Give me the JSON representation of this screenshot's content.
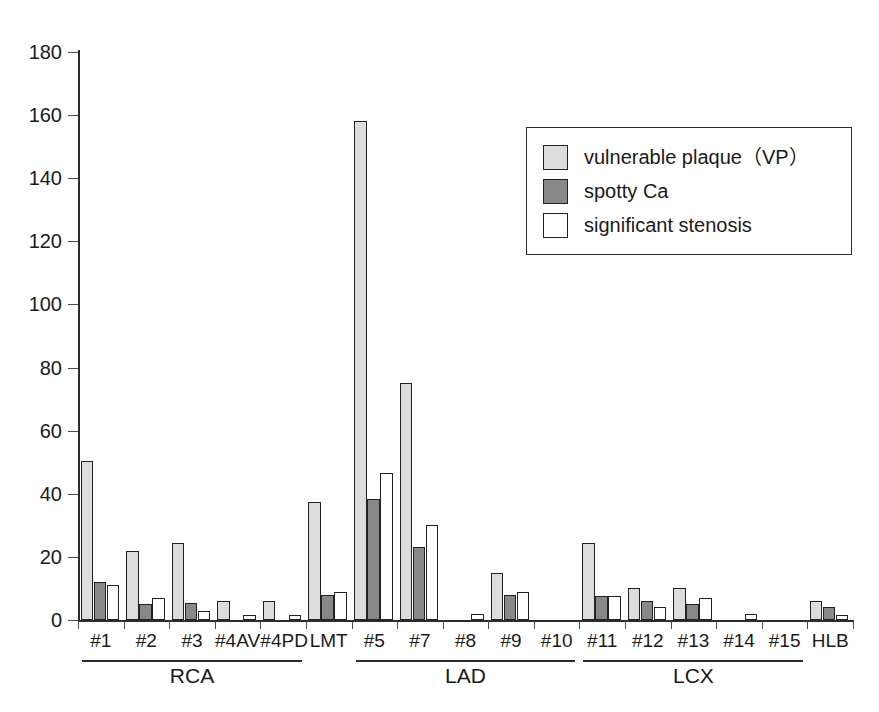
{
  "chart_data": {
    "type": "bar",
    "title": "",
    "xlabel": "",
    "ylabel": "",
    "ylim": [
      0,
      180
    ],
    "ytick_labels": [
      "180",
      "160",
      "140",
      "120",
      "100",
      "80",
      "60",
      "40",
      "20",
      "0"
    ],
    "yticks": [
      180,
      160,
      140,
      120,
      100,
      80,
      60,
      40,
      20,
      0
    ],
    "grid": false,
    "legend_position": "upper right",
    "categories": [
      "#1",
      "#2",
      "#3",
      "#4AV",
      "#4PD",
      "LMT",
      "#5",
      "#7",
      "#8",
      "#9",
      "#10",
      "#11",
      "#12",
      "#13",
      "#14",
      "#15",
      "HLB"
    ],
    "series": [
      {
        "name": "vulnerable plaque (VP)",
        "color": "#dcdcdc",
        "values": [
          50.5,
          22,
          24.5,
          6,
          6,
          37.5,
          158,
          75,
          0,
          15,
          0,
          24.5,
          10,
          10,
          0,
          0,
          6
        ]
      },
      {
        "name": "spotty Ca",
        "color": "#888888",
        "values": [
          12,
          5,
          5.5,
          0,
          0,
          8,
          38.5,
          23,
          0,
          8,
          0,
          7.5,
          6,
          5,
          0,
          0,
          4
        ]
      },
      {
        "name": "significant stenosis",
        "color": "#ffffff",
        "values": [
          11,
          7,
          3,
          1.5,
          1.5,
          9,
          46.5,
          30,
          2,
          9,
          0,
          7.5,
          4,
          7,
          2,
          0,
          1.5
        ]
      }
    ],
    "group_brackets": [
      {
        "label": "RCA",
        "start_category": "#1",
        "end_category": "#4PD"
      },
      {
        "label": "LAD",
        "start_category": "#5",
        "end_category": "#10"
      },
      {
        "label": "LCX",
        "start_category": "#11",
        "end_category": "#15"
      }
    ]
  },
  "legend": {
    "items": [
      {
        "label": "vulnerable plaque（VP）",
        "swatch": "vp"
      },
      {
        "label": "spotty Ca",
        "swatch": "spotty"
      },
      {
        "label": "significant stenosis",
        "swatch": "stenosis"
      }
    ]
  },
  "colors": {
    "vulnerable_plaque": "#dcdcdc",
    "spotty_ca": "#888888",
    "significant_stenosis": "#ffffff",
    "axis": "#2b2b2b"
  }
}
